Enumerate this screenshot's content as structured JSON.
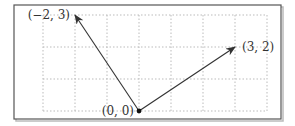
{
  "diagram": {
    "type": "vector-plot",
    "colors": {
      "frame": "#555555",
      "frame_shadow": "#bbbbbb",
      "grid": "#bbbbbb",
      "vector": "#333333",
      "origin_dot": "#111111",
      "label": "#333333"
    },
    "grid": {
      "x_range": [
        -3,
        4
      ],
      "y_range": [
        0,
        3
      ],
      "cell_px": 32,
      "origin_px": [
        139,
        111
      ],
      "style": "dotted"
    },
    "origin": {
      "x": 0,
      "y": 0,
      "label": "(0, 0)"
    },
    "vectors": [
      {
        "from": [
          0,
          0
        ],
        "to": [
          -2,
          3
        ],
        "label": "(−2, 3)"
      },
      {
        "from": [
          0,
          0
        ],
        "to": [
          3,
          2
        ],
        "label": "(3, 2)"
      }
    ]
  }
}
